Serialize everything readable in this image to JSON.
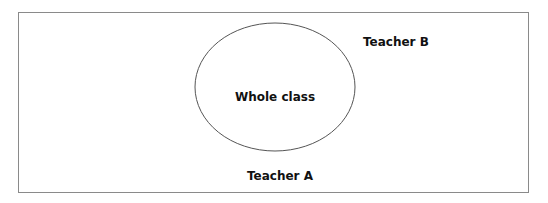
{
  "diagram": {
    "type": "set-diagram",
    "outer_region": {
      "label": "Teacher A"
    },
    "inner_region": {
      "label": "Whole class",
      "shape": "ellipse"
    },
    "outside_label": "Teacher B"
  },
  "labels": {
    "whole_class": "Whole class",
    "teacher_b": "Teacher B",
    "teacher_a": "Teacher A"
  },
  "colors": {
    "border": "#8a8a8a",
    "ellipse_stroke": "#555555",
    "text": "#111111",
    "background": "#ffffff"
  }
}
